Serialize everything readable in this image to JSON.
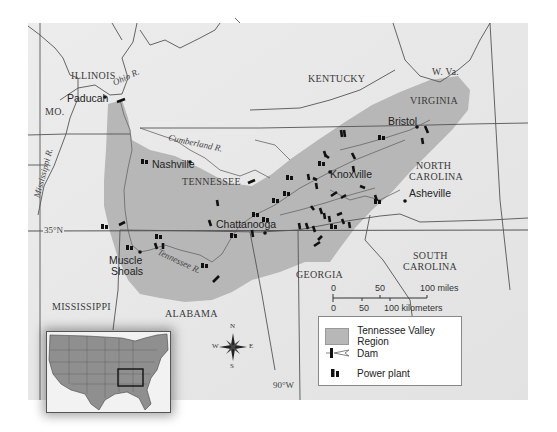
{
  "map": {
    "states": {
      "illinois": "ILLINOIS",
      "missouri": "MO.",
      "kentucky": "KENTUCKY",
      "west_virginia": "W. Va.",
      "virginia": "VIRGINIA",
      "tennessee": "TENNESSEE",
      "north_carolina_1": "NORTH",
      "north_carolina_2": "CAROLINA",
      "south_carolina_1": "SOUTH",
      "south_carolina_2": "CAROLINA",
      "georgia": "GEORGIA",
      "alabama": "ALABAMA",
      "mississippi": "MISSISSIPPI"
    },
    "cities": {
      "paducah": "Paducah",
      "nashville": "Nashville",
      "bristol": "Bristol",
      "knoxville": "Knoxville",
      "asheville": "Asheville",
      "chattanooga": "Chattanooga",
      "muscle_shoals_1": "Muscle",
      "muscle_shoals_2": "Shoals"
    },
    "rivers": {
      "ohio": "Ohio R.",
      "cumberland": "Cumberland R.",
      "mississippi": "Mississippi R.",
      "tennessee": "Tennessee R."
    },
    "graticule": {
      "latitude": "35°N",
      "longitude": "90°W"
    },
    "compass": {
      "n": "N",
      "s": "S",
      "e": "E",
      "w": "W"
    },
    "colors": {
      "background": "#e9e9e9",
      "valley_region": "#b7b7b7",
      "border": "#555555"
    }
  },
  "scale": {
    "miles": {
      "ticks": [
        "0",
        "50",
        "100 miles"
      ]
    },
    "kilometers": {
      "ticks": [
        "0",
        "50",
        "100 kilometers"
      ]
    }
  },
  "legend": {
    "items": [
      {
        "icon": "region-swatch",
        "label": "Tennessee Valley Region"
      },
      {
        "icon": "dam-icon",
        "label": "Dam"
      },
      {
        "icon": "power-plant-icon",
        "label": "Power plant"
      }
    ]
  }
}
